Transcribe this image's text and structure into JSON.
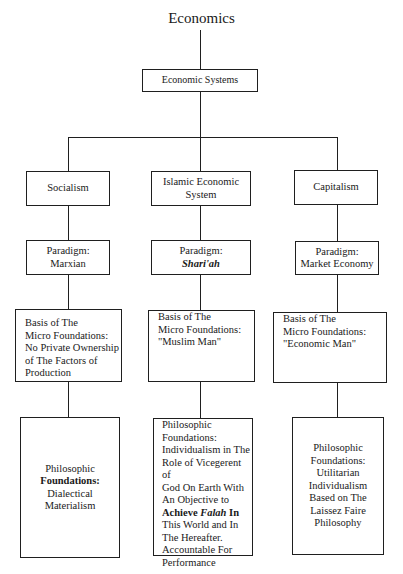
{
  "title": "Economics",
  "root": {
    "label": "Economic Systems"
  },
  "systems": [
    {
      "name": "Socialism",
      "paradigm": {
        "prefix": "Paradigm:",
        "value": "Marxian"
      },
      "basis": [
        "Basis of The",
        "Micro Foundations:",
        "No Private Ownership",
        "of The Factors of",
        "Production"
      ],
      "philosophy": {
        "line1": "Philosophic",
        "line2": "Foundations:",
        "line3": "Dialectical",
        "line4": "Materialism"
      }
    },
    {
      "name_line1": "Islamic Economic",
      "name_line2": "System",
      "paradigm": {
        "prefix": "Paradigm:",
        "value": "Shari'ah"
      },
      "basis": [
        "Basis of The",
        "Micro Foundations:",
        "\"Muslim Man\""
      ],
      "philosophy": {
        "lines_before": [
          "Philosophic",
          "Foundations:",
          "Individualism in The",
          "Role of Vicegerent of",
          "God On Earth With",
          "An Objective to"
        ],
        "bold_achieve": "Achieve",
        "bold_italic_falah": "Falah",
        "bold_in": "In",
        "lines_after": [
          "This World and In",
          "The Hereafter.",
          "Accountable For",
          "Performance"
        ]
      }
    },
    {
      "name": "Capitalism",
      "paradigm": {
        "prefix": "Paradigm:",
        "value": "Market Economy"
      },
      "basis": [
        "Basis of The",
        "Micro Foundations:",
        "\"Economic Man\""
      ],
      "philosophy": [
        "Philosophic",
        "Foundations:",
        "Utilitarian",
        "Individualism",
        "Based on The",
        "Laissez Faire",
        "Philosophy"
      ]
    }
  ]
}
